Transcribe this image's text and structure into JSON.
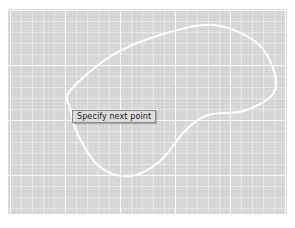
{
  "app": {
    "name": "cad-drawing-canvas",
    "mode": "spline-draw"
  },
  "canvas": {
    "background_color": "#d9d9d9",
    "grid": {
      "visible": true,
      "minor_spacing_px": 11,
      "major_spacing_px": 55,
      "minor_color": "#f0f0f0",
      "major_color": "#fbfbfb"
    },
    "bounds": {
      "x": 8,
      "y": 9,
      "width": 279,
      "height": 205
    }
  },
  "geometry": {
    "name": "closed-spline",
    "stroke_color": "#ffffff",
    "stroke_width": 2,
    "closed": true,
    "points": [
      {
        "x": 62,
        "y": 82
      },
      {
        "x": 103,
        "y": 47
      },
      {
        "x": 152,
        "y": 26
      },
      {
        "x": 205,
        "y": 16
      },
      {
        "x": 248,
        "y": 33
      },
      {
        "x": 266,
        "y": 62
      },
      {
        "x": 265,
        "y": 85
      },
      {
        "x": 236,
        "y": 102
      },
      {
        "x": 200,
        "y": 106
      },
      {
        "x": 177,
        "y": 122
      },
      {
        "x": 151,
        "y": 153
      },
      {
        "x": 122,
        "y": 167
      },
      {
        "x": 92,
        "y": 158
      },
      {
        "x": 70,
        "y": 126
      },
      {
        "x": 62,
        "y": 99
      }
    ]
  },
  "tooltip": {
    "visible": true,
    "text": "Specify next point",
    "position": {
      "x": 72,
      "y": 110
    },
    "background_color": "#dcdcdc",
    "border_color": "#8b8b8b",
    "text_color": "#1a1a1a"
  }
}
